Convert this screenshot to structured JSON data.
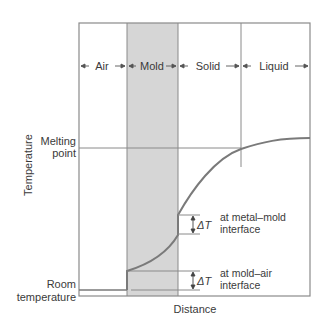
{
  "diagram": {
    "regions": [
      {
        "label": "Air"
      },
      {
        "label": "Mold"
      },
      {
        "label": "Solid"
      },
      {
        "label": "Liquid"
      }
    ],
    "axes": {
      "y_label": "Temperature",
      "x_label": "Distance",
      "y_ticks": [
        {
          "label_line1": "Melting",
          "label_line2": "point"
        },
        {
          "label_line1": "Room",
          "label_line2": "temperature"
        }
      ]
    },
    "annotations": [
      {
        "symbol": "ΔT",
        "line1": "at metal–mold",
        "line2": "interface"
      },
      {
        "symbol": "ΔT",
        "line1": "at mold–air",
        "line2": "interface"
      }
    ],
    "colors": {
      "mold_fill": "#d6d6d6",
      "curve": "#7a7a7a",
      "frame": "#8a8a8a",
      "text": "#3a3a3a"
    }
  }
}
